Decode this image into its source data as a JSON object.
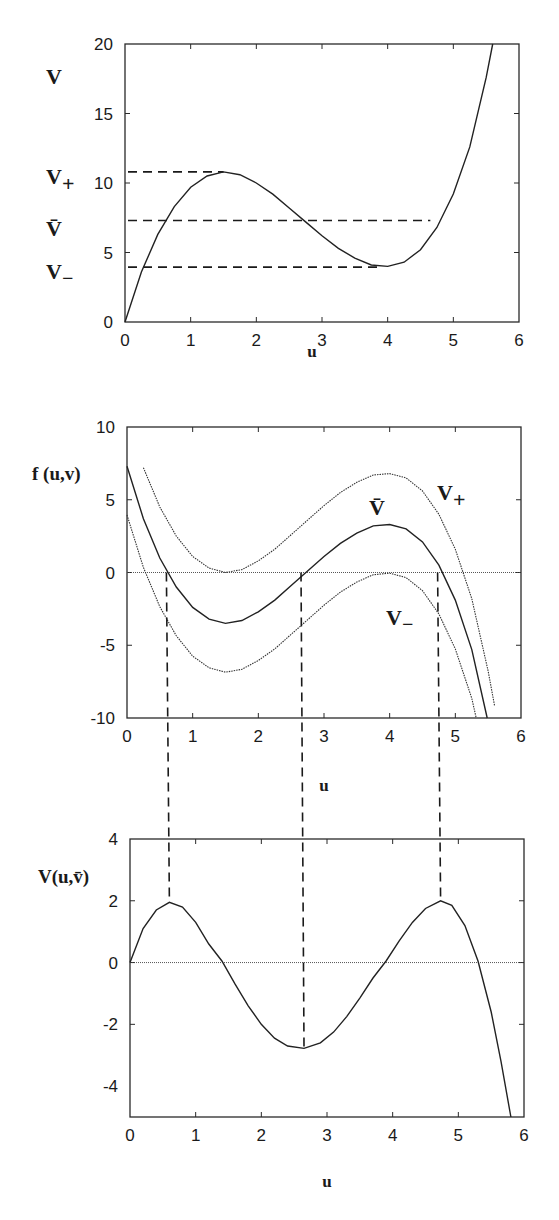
{
  "figure": {
    "panels": [
      {
        "id": "top",
        "ylabel": "V",
        "xlabel": "u",
        "xticks": [
          "0",
          "1",
          "2",
          "3",
          "4",
          "5",
          "6"
        ],
        "yticks": [
          "0",
          "5",
          "10",
          "15",
          "20"
        ],
        "level_labels": {
          "v_plus": "V",
          "v_plus_sub": "+",
          "v_bar": "V̄",
          "v_minus": "V",
          "v_minus_sub": "−"
        }
      },
      {
        "id": "middle",
        "ylabel": "f (u,v)",
        "xlabel": "u",
        "xticks": [
          "0",
          "1",
          "2",
          "3",
          "4",
          "5",
          "6"
        ],
        "yticks": [
          "-10",
          "-5",
          "0",
          "5",
          "10"
        ],
        "curve_labels": {
          "v_plus": "V",
          "v_plus_sub": "+",
          "v_bar": "V̄",
          "v_minus": "V",
          "v_minus_sub": "−"
        }
      },
      {
        "id": "bottom",
        "ylabel": "V(u,v̄)",
        "xlabel": "u",
        "xticks": [
          "0",
          "1",
          "2",
          "3",
          "4",
          "5",
          "6"
        ],
        "yticks": [
          "-4",
          "-2",
          "0",
          "2",
          "4"
        ]
      }
    ]
  },
  "chart_data": [
    {
      "type": "line",
      "title": "",
      "xlabel": "u",
      "ylabel": "V",
      "xlim": [
        0,
        6
      ],
      "ylim": [
        0,
        20
      ],
      "grid": false,
      "x": [
        0,
        0.25,
        0.5,
        0.75,
        1,
        1.25,
        1.5,
        1.75,
        2,
        2.25,
        2.5,
        2.75,
        3,
        3.25,
        3.5,
        3.75,
        4,
        4.25,
        4.5,
        4.75,
        5,
        5.25,
        5.5,
        5.6
      ],
      "series": [
        {
          "name": "nullcline v(u)",
          "style": "solid",
          "values": [
            0,
            3.6,
            6.3,
            8.3,
            9.7,
            10.5,
            10.8,
            10.6,
            10.0,
            9.2,
            8.2,
            7.2,
            6.2,
            5.3,
            4.6,
            4.1,
            4.0,
            4.3,
            5.2,
            6.8,
            9.2,
            12.6,
            17.6,
            20
          ]
        }
      ],
      "reference_lines": [
        {
          "name": "V+",
          "y": 10.8,
          "x_range": [
            0,
            1.5
          ],
          "style": "dashed"
        },
        {
          "name": "V̄",
          "y": 7.3,
          "x_range": [
            0,
            4.65
          ],
          "style": "dashed"
        },
        {
          "name": "V−",
          "y": 3.95,
          "x_range": [
            0,
            3.9
          ],
          "style": "dashed"
        }
      ],
      "annotations": [
        "V+",
        "V̄",
        "V−"
      ]
    },
    {
      "type": "line",
      "title": "",
      "xlabel": "u",
      "ylabel": "f (u,v)",
      "xlim": [
        0,
        6
      ],
      "ylim": [
        -10,
        10
      ],
      "grid": false,
      "x": [
        0,
        0.25,
        0.5,
        0.75,
        1,
        1.25,
        1.5,
        1.75,
        2,
        2.25,
        2.5,
        2.75,
        3,
        3.25,
        3.5,
        3.75,
        4,
        4.25,
        4.5,
        4.75,
        5,
        5.25,
        5.5,
        5.6
      ],
      "series": [
        {
          "name": "V+",
          "style": "dotted",
          "v": 10.8,
          "values": [
            10.8,
            7.2,
            4.5,
            2.5,
            1.1,
            0.3,
            0,
            0.2,
            0.8,
            1.6,
            2.6,
            3.6,
            4.6,
            5.5,
            6.2,
            6.7,
            6.8,
            6.5,
            5.6,
            4.0,
            1.6,
            -1.8,
            -6.8,
            -9.2
          ]
        },
        {
          "name": "V̄",
          "style": "solid",
          "v": 7.3,
          "values": [
            7.3,
            3.7,
            1.0,
            -1.0,
            -2.4,
            -3.2,
            -3.5,
            -3.3,
            -2.7,
            -1.9,
            -0.9,
            0.1,
            1.1,
            2.0,
            2.7,
            3.2,
            3.3,
            3.0,
            2.1,
            0.5,
            -1.9,
            -5.3,
            -10.3,
            -12.7
          ]
        },
        {
          "name": "V−",
          "style": "dotted",
          "v": 3.95,
          "values": [
            3.95,
            0.35,
            -2.35,
            -4.35,
            -5.75,
            -6.55,
            -6.85,
            -6.65,
            -6.05,
            -5.25,
            -4.25,
            -3.25,
            -2.25,
            -1.35,
            -0.65,
            -0.15,
            -0.05,
            -0.35,
            -1.25,
            -2.85,
            -5.25,
            -8.65,
            -13.65,
            -16.05
          ]
        }
      ],
      "zero_line": true,
      "vertical_dashed_lines_u": [
        0.6,
        2.65,
        4.73
      ],
      "annotations": [
        "V+",
        "V̄",
        "V−"
      ]
    },
    {
      "type": "line",
      "title": "",
      "xlabel": "u",
      "ylabel": "V(u,v̄)",
      "xlim": [
        0,
        6
      ],
      "ylim": [
        -5,
        4
      ],
      "grid": false,
      "x": [
        0,
        0.2,
        0.4,
        0.6,
        0.8,
        1,
        1.2,
        1.4,
        1.6,
        1.8,
        2,
        2.2,
        2.4,
        2.65,
        2.9,
        3.1,
        3.3,
        3.5,
        3.7,
        3.9,
        4.1,
        4.3,
        4.5,
        4.73,
        4.9,
        5.1,
        5.3,
        5.5,
        5.65,
        5.8
      ],
      "series": [
        {
          "name": "V(u,v̄)",
          "style": "solid",
          "values": [
            0,
            1.1,
            1.7,
            1.95,
            1.8,
            1.3,
            0.6,
            0.05,
            -0.7,
            -1.4,
            -2.0,
            -2.45,
            -2.7,
            -2.78,
            -2.6,
            -2.25,
            -1.75,
            -1.15,
            -0.5,
            0.05,
            0.7,
            1.3,
            1.75,
            2.0,
            1.85,
            1.2,
            0.05,
            -1.6,
            -3.2,
            -5.0
          ]
        }
      ],
      "zero_line": true,
      "vertical_dashed_lines_u": [
        0.6,
        2.65,
        4.73
      ]
    }
  ]
}
